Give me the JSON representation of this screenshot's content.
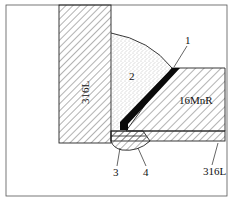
{
  "diagram": {
    "type": "weld-joint-cross-section",
    "parts": {
      "vertical_plate": {
        "material": "316L"
      },
      "horizontal_plate": {
        "material": "16MnR"
      },
      "bottom_cladding": {
        "material": "316L"
      }
    },
    "callouts": [
      {
        "id": "1",
        "label": "1",
        "describes": "transition weld layer"
      },
      {
        "id": "2",
        "label": "2",
        "describes": "fillet weld fill"
      },
      {
        "id": "3",
        "label": "3",
        "describes": "backing weld"
      },
      {
        "id": "4",
        "label": "4",
        "describes": "root weld"
      }
    ],
    "colors": {
      "line": "#222222",
      "hatch": "#555555",
      "weld_black": "#0a0a0a",
      "stipple": "#888888"
    }
  }
}
